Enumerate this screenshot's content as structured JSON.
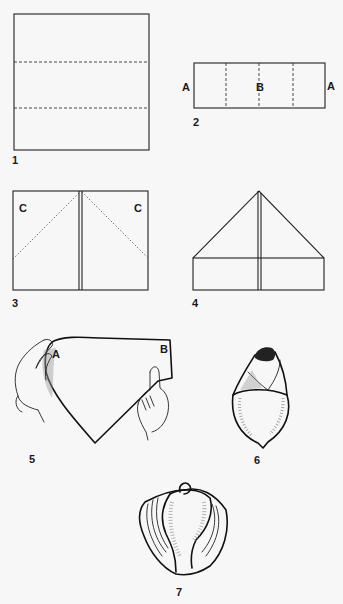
{
  "colors": {
    "background": "#f7f7f7",
    "ink": "#1a1a1a"
  },
  "steps": [
    {
      "number": "1",
      "description": "Square sheet with two horizontal dashed fold lines dividing it into thirds",
      "labels": []
    },
    {
      "number": "2",
      "description": "Folded strip with three vertical dashed fold lines",
      "labels": [
        "A",
        "B",
        "A"
      ]
    },
    {
      "number": "3",
      "description": "Rectangle with center seam and dotted diagonal folds at top corners",
      "labels": [
        "C",
        "C"
      ]
    },
    {
      "number": "4",
      "description": "Top corners folded down to form a triangle over a rectangle base",
      "labels": []
    },
    {
      "number": "5",
      "description": "Hands curving the folded shape, bringing corner A toward B",
      "labels": [
        "A",
        "B"
      ]
    },
    {
      "number": "6",
      "description": "Rolled bud shape",
      "labels": []
    },
    {
      "number": "7",
      "description": "Finished flower with layered petals",
      "labels": []
    }
  ]
}
